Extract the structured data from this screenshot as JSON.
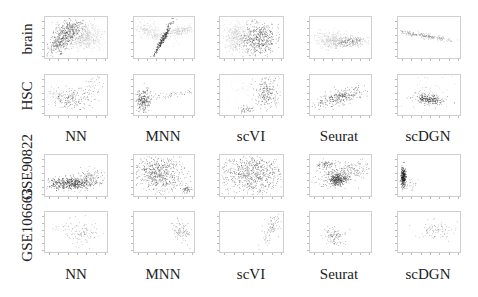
{
  "figure": {
    "row_labels": [
      "brain",
      "HSC",
      "GSE90822",
      "GSE106663"
    ],
    "column_labels_top": [
      "NN",
      "MNN",
      "scVI",
      "Seurat",
      "scDGN"
    ],
    "column_labels_bottom": [
      "NN",
      "MNN",
      "scVI",
      "Seurat",
      "scDGN"
    ]
  },
  "chart_data": {
    "type": "scatter",
    "title": "",
    "layout": "grid 4 rows x 5 columns of 2D embedding scatter plots",
    "rows": [
      "brain",
      "HSC",
      "GSE90822",
      "GSE106663"
    ],
    "columns": [
      "NN",
      "MNN",
      "scVI",
      "Seurat",
      "scDGN"
    ],
    "xlabel": "",
    "ylabel": "",
    "grid": false,
    "legend": "none",
    "panels": [
      {
        "row": "brain",
        "method": "NN",
        "description": "dark cluster left, light gray cluster right, overlapping"
      },
      {
        "row": "brain",
        "method": "MNN",
        "description": "V-shape: light gray arms, dark narrow diagonal streak center"
      },
      {
        "row": "brain",
        "method": "scVI",
        "description": "light gray blob left, dark dense blob right"
      },
      {
        "row": "brain",
        "method": "Seurat",
        "description": "elongated horizontal mixed gray band"
      },
      {
        "row": "brain",
        "method": "scDGN",
        "description": "thin diagonal line from upper left descending right"
      },
      {
        "row": "HSC",
        "method": "NN",
        "description": "scattered points, faint light cluster left, diagonal upward right"
      },
      {
        "row": "HSC",
        "method": "MNN",
        "description": "dense cluster lower left, line of points rising to right"
      },
      {
        "row": "HSC",
        "method": "scVI",
        "description": "small cluster bottom center, spread cluster upper right"
      },
      {
        "row": "HSC",
        "method": "Seurat",
        "description": "diagonal band lower-left to upper-right"
      },
      {
        "row": "HSC",
        "method": "scDGN",
        "description": "dense cluster center-lower, sparse points around"
      },
      {
        "row": "GSE90822",
        "method": "NN",
        "description": "dense horizontal band at bottom rising right"
      },
      {
        "row": "GSE90822",
        "method": "MNN",
        "description": "arch-shaped cloud, dense lower-right tip"
      },
      {
        "row": "GSE90822",
        "method": "scVI",
        "description": "broad diffuse cloud filling panel"
      },
      {
        "row": "GSE90822",
        "method": "Seurat",
        "description": "dense cluster center, diagonal spread to upper right"
      },
      {
        "row": "GSE90822",
        "method": "scDGN",
        "description": "very dense compact vertical cluster at left edge"
      },
      {
        "row": "GSE106663",
        "method": "NN",
        "description": "sparse scatter center-right"
      },
      {
        "row": "GSE106663",
        "method": "MNN",
        "description": "sparse diagonal cluster right"
      },
      {
        "row": "GSE106663",
        "method": "scVI",
        "description": "sparse vertical cluster right"
      },
      {
        "row": "GSE106663",
        "method": "Seurat",
        "description": "small sparse cluster center-left"
      },
      {
        "row": "GSE106663",
        "method": "scDGN",
        "description": "sparse diagonal cluster upper-right"
      }
    ]
  }
}
